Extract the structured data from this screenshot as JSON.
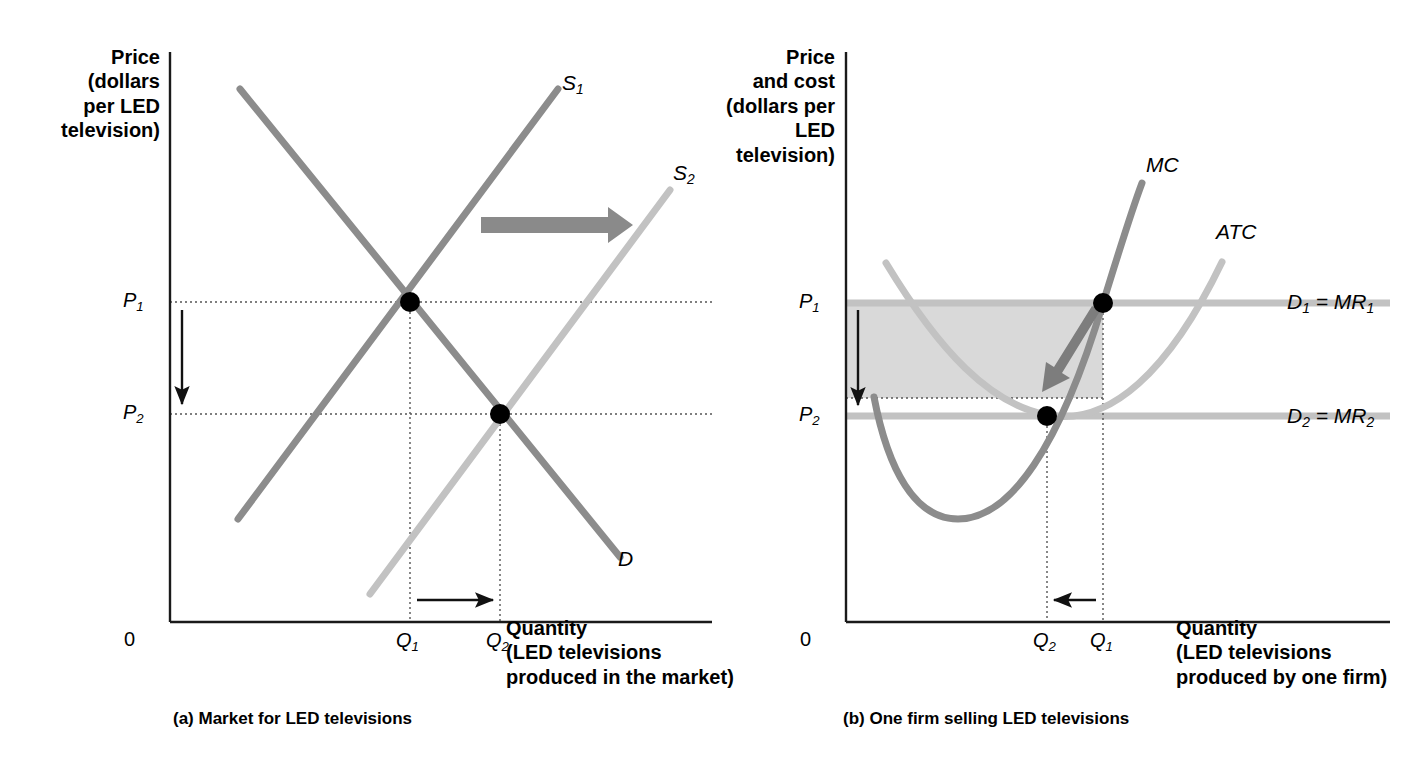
{
  "figure": {
    "background": "#ffffff",
    "width": 1426,
    "height": 772
  },
  "colors": {
    "supply1": "#8c8c8c",
    "supply2": "#bdbdbd",
    "demand": "#8c8c8c",
    "mc": "#8c8c8c",
    "atc": "#bdbdbd",
    "demand_line": "#bdbdbd",
    "shift_arrow": "#8a8a8a",
    "shaded_box": "#d9d9d9",
    "axis": "#1a1a1a",
    "dot": "#000000",
    "dotted": "#555555"
  },
  "panel_a": {
    "name": "Market for LED televisions",
    "caption": "(a) Market for LED televisions",
    "y_axis_title": "Price\n(dollars\nper LED\ntelevision)",
    "x_axis_title": "Quantity\n(LED televisions\nproduced in the market)",
    "origin_label": "0",
    "price_labels": [
      "P",
      "P"
    ],
    "price_subs": [
      "1",
      "2"
    ],
    "quantity_labels": [
      "Q",
      "Q"
    ],
    "quantity_subs": [
      "1",
      "2"
    ],
    "curve_labels": [
      {
        "text": "S",
        "sub": "1",
        "name": "supply-curve-1-label"
      },
      {
        "text": "S",
        "sub": "2",
        "name": "supply-curve-2-label"
      },
      {
        "text": "D",
        "sub": "",
        "name": "demand-curve-label"
      }
    ]
  },
  "panel_b": {
    "name": "One firm selling LED televisions",
    "caption": "(b) One firm selling LED televisions",
    "y_axis_title": "Price\nand cost\n(dollars per\nLED\ntelevision)",
    "x_axis_title": "Quantity\n(LED televisions\nproduced by one firm)",
    "origin_label": "0",
    "price_labels": [
      "P",
      "P"
    ],
    "price_subs": [
      "1",
      "2"
    ],
    "quantity_labels": [
      "Q",
      "Q"
    ],
    "quantity_subs": [
      "2",
      "1"
    ],
    "curve_labels": [
      {
        "text": "MC",
        "name": "marginal-cost-label"
      },
      {
        "text": "ATC",
        "name": "average-total-cost-label"
      }
    ],
    "demand_labels": [
      {
        "d": "D",
        "dsub": "1",
        "eq": " = ",
        "mr": "MR",
        "mrsub": "1",
        "name": "demand-mr-1-label"
      },
      {
        "d": "D",
        "dsub": "2",
        "eq": " = ",
        "mr": "MR",
        "mrsub": "2",
        "name": "demand-mr-2-label"
      }
    ]
  },
  "chart_data": {
    "type": "line",
    "panels": [
      {
        "id": "a",
        "title": "(a) Market for LED televisions",
        "xlabel": "Quantity (LED televisions produced in the market)",
        "ylabel": "Price (dollars per LED television)",
        "grid": false,
        "legend": "inline-curve-labels",
        "axis_ranges": {
          "x": [
            0,
            1
          ],
          "y": [
            0,
            1
          ]
        },
        "series": [
          {
            "name": "D",
            "type": "line",
            "points": [
              [
                0.09,
                0.95
              ],
              [
                0.93,
                0.1
              ]
            ],
            "color": "#8c8c8c"
          },
          {
            "name": "S1",
            "type": "line",
            "points": [
              [
                0.16,
                0.05
              ],
              [
                0.87,
                0.95
              ]
            ],
            "color": "#8c8c8c"
          },
          {
            "name": "S2",
            "type": "line",
            "points": [
              [
                0.43,
                0.02
              ],
              [
                1.11,
                0.78
              ]
            ],
            "color": "#bdbdbd"
          }
        ],
        "equilibria": [
          {
            "label": "E1",
            "x_tick": "Q1",
            "y_tick": "P1",
            "x": 0.45,
            "y": 0.59
          },
          {
            "label": "E2",
            "x_tick": "Q2",
            "y_tick": "P2",
            "x": 0.64,
            "y": 0.38
          }
        ],
        "annotations": [
          {
            "kind": "shift-arrow",
            "direction": "right",
            "from": "S1",
            "to": "S2"
          },
          {
            "kind": "price-arrow",
            "direction": "down",
            "from": "P1",
            "to": "P2"
          },
          {
            "kind": "quantity-arrow",
            "direction": "right",
            "from": "Q1",
            "to": "Q2"
          }
        ],
        "xticks": [
          "0",
          "Q1",
          "Q2"
        ],
        "yticks": [
          "P1",
          "P2"
        ]
      },
      {
        "id": "b",
        "title": "(b) One firm selling LED televisions",
        "xlabel": "Quantity (LED televisions produced by one firm)",
        "ylabel": "Price and cost (dollars per LED television)",
        "grid": false,
        "legend": "inline-curve-labels",
        "axis_ranges": {
          "x": [
            0,
            1
          ],
          "y": [
            0,
            1
          ]
        },
        "series": [
          {
            "name": "MC",
            "type": "curve",
            "shape": "u-shaped-rising",
            "minimum": [
              0.28,
              0.24
            ],
            "color": "#8c8c8c"
          },
          {
            "name": "ATC",
            "type": "curve",
            "shape": "u-shaped",
            "minimum": [
              0.52,
              0.36
            ],
            "color": "#bdbdbd"
          },
          {
            "name": "D1 = MR1",
            "type": "horizontal-line",
            "y": 0.59,
            "color": "#bdbdbd"
          },
          {
            "name": "D2 = MR2",
            "type": "horizontal-line",
            "y": 0.36,
            "color": "#bdbdbd"
          }
        ],
        "equilibria": [
          {
            "label": "E1",
            "x_tick": "Q1",
            "y_tick": "P1",
            "x": 0.66,
            "y": 0.59
          },
          {
            "label": "E2",
            "x_tick": "Q2",
            "y_tick": "P2",
            "x": 0.52,
            "y": 0.36
          }
        ],
        "annotations": [
          {
            "kind": "profit-box",
            "shaded": true,
            "top": "P1",
            "bottom": "ATC at Q1",
            "left": 0,
            "right": "Q1"
          },
          {
            "kind": "price-arrow",
            "direction": "down",
            "from": "P1",
            "to": "P2"
          },
          {
            "kind": "quantity-arrow",
            "direction": "left",
            "from": "Q1",
            "to": "Q2"
          },
          {
            "kind": "adjustment-arrow",
            "direction": "down-left",
            "from": "E1",
            "to": "E2"
          }
        ],
        "xticks": [
          "0",
          "Q2",
          "Q1"
        ],
        "yticks": [
          "P1",
          "P2"
        ]
      }
    ]
  }
}
